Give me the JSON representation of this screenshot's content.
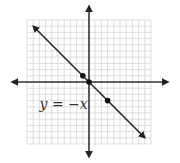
{
  "chart_data": {
    "type": "line",
    "title": "",
    "xlabel": "",
    "ylabel": "",
    "xlim": [
      -10,
      10
    ],
    "ylim": [
      -10,
      10
    ],
    "grid": true,
    "grid_step": 1,
    "axes_arrows": true,
    "series": [
      {
        "name": "y = -x",
        "equation_label": "y = −x",
        "slope": -1,
        "intercept": 0,
        "x_range": [
          -9,
          9
        ],
        "arrows_both_ends": true,
        "color": "#222222"
      }
    ],
    "points": [
      {
        "x": -1,
        "y": 1
      },
      {
        "x": 0,
        "y": 0
      },
      {
        "x": 3,
        "y": -3
      }
    ],
    "annotations": [
      {
        "text": "y = −x",
        "x": -7,
        "y": -3.5
      }
    ],
    "colors": {
      "grid": "#d0d0d0",
      "axes": "#333333",
      "line": "#222222",
      "points": "#111111"
    }
  }
}
